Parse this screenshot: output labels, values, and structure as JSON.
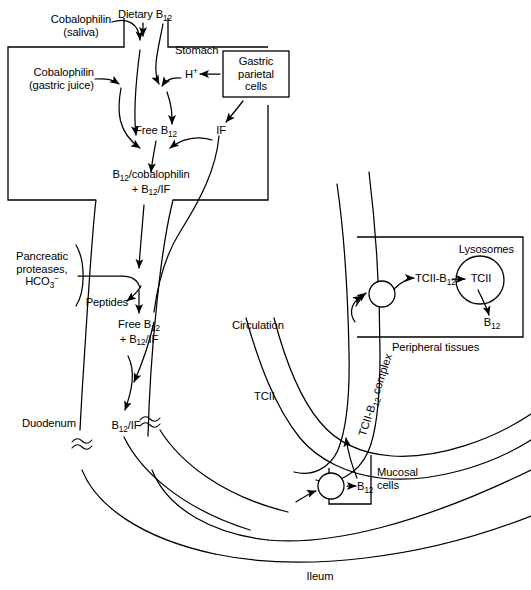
{
  "figure": {
    "background": "#ffffff",
    "ink": "#000000"
  },
  "labels": {
    "cobalophilin_saliva": "Cobalophilin\n(saliva)",
    "cobalophilin_saliva_l1": "Cobalophilin",
    "cobalophilin_saliva_l2": "(saliva)",
    "dietary_b12": "Dietary B",
    "dietary_b12_sub": "12",
    "stomach": "Stomach",
    "cobalophilin_gastric_l1": "Cobalophilin",
    "cobalophilin_gastric_l2": "(gastric juice)",
    "hydrogen_ion": "H",
    "hydrogen_ion_sup": "+",
    "gastric_parietal_l1": "Gastric",
    "gastric_parietal_l2": "parietal",
    "gastric_parietal_l3": "cells",
    "free_b12": "Free B",
    "free_b12_sub": "12",
    "intrinsic_factor": "IF",
    "complex_l1_a": "B",
    "complex_l1_sub": "12",
    "complex_l1_b": "/cobalophilin",
    "complex_l2_a": "+ B",
    "complex_l2_sub": "12",
    "complex_l2_b": "/IF",
    "pancreatic_l1": "Pancreatic",
    "pancreatic_l2": "proteases,",
    "pancreatic_l3_a": "HCO",
    "pancreatic_l3_sub": "3",
    "pancreatic_l3_sup": "−",
    "peptides": "Peptides",
    "free_b12_if_l1_a": "Free B",
    "free_b12_if_l1_sub": "12",
    "free_b12_if_l2_a": "+ B",
    "free_b12_if_l2_sub": "12",
    "free_b12_if_l2_b": "/IF",
    "duodenum": "Duodenum",
    "b12_if_a": "B",
    "b12_if_sub": "12",
    "b12_if_b": "/IF",
    "circulation": "Circulation",
    "tcii": "TCII",
    "tcii_b12_complex_a": "TCII-B",
    "tcii_b12_complex_sub": "12",
    "tcii_b12_complex_b": " complex",
    "lysosomes": "Lysosomes",
    "tcii_b12_a": "TCII-B",
    "tcii_b12_sub": "12",
    "tcii_lyso": "TCII",
    "b12_released": "B",
    "b12_released_sub": "12",
    "peripheral_tissues": "Peripheral tissues",
    "mucosal_l1": "Mucosal",
    "mucosal_l2": "cells",
    "b12_mucosal": "B",
    "b12_mucosal_sub": "12",
    "ileum": "Ileum"
  },
  "regions": [
    {
      "name": "stomach",
      "label": "Stomach"
    },
    {
      "name": "gastric-parietal-cells",
      "label": "Gastric parietal cells"
    },
    {
      "name": "duodenum",
      "label": "Duodenum"
    },
    {
      "name": "ileum",
      "label": "Ileum"
    },
    {
      "name": "peripheral-tissues",
      "label": "Peripheral tissues"
    },
    {
      "name": "lysosomes",
      "label": "Lysosomes"
    },
    {
      "name": "mucosal-cells",
      "label": "Mucosal cells"
    }
  ]
}
